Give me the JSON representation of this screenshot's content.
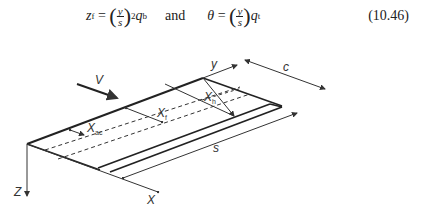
{
  "equation": {
    "lhs1_var": "z",
    "lhs1_sub": "f",
    "frac_num": "y",
    "frac_den": "s",
    "exp": "2",
    "q1": "q",
    "q1_sub": "b",
    "conjunction": "and",
    "lhs2_var": "θ",
    "q2": "q",
    "q2_sub": "t",
    "equals": "=",
    "number": "(10.46)"
  },
  "diagram": {
    "labels": {
      "V": "V",
      "y": "y",
      "c": "c",
      "s": "s",
      "Z": "Z",
      "X": "X",
      "x_h": "X",
      "x_h_sub": "h",
      "x_f": "X",
      "x_f_sub": "f",
      "x_ac": "X",
      "x_ac_sub": "ac"
    }
  }
}
